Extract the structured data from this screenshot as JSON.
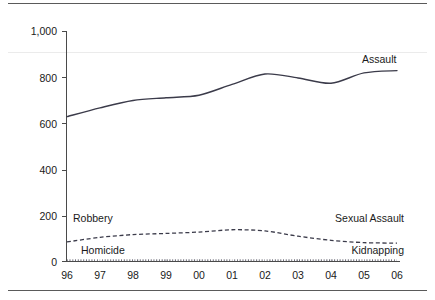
{
  "chart_data": {
    "type": "line",
    "title": "",
    "subtitle": "",
    "xlabel": "",
    "ylabel": "",
    "x": [
      "96",
      "97",
      "98",
      "99",
      "00",
      "01",
      "02",
      "03",
      "04",
      "05",
      "06"
    ],
    "xtick_labels": [
      "96",
      "97",
      "98",
      "99",
      "00",
      "01",
      "02",
      "03",
      "04",
      "05",
      "06"
    ],
    "ytick_labels": [
      "0",
      "200",
      "400",
      "600",
      "800",
      "1,000"
    ],
    "ytick_values": [
      0,
      200,
      400,
      600,
      800,
      1000
    ],
    "ylim": [
      0,
      1000
    ],
    "grid": false,
    "legend_position": "inline-annotations",
    "series": [
      {
        "name": "Assault",
        "style": "solid",
        "label": "Assault",
        "values": [
          630,
          668,
          700,
          712,
          723,
          770,
          815,
          798,
          775,
          820,
          830
        ]
      },
      {
        "name": "Robbery / Sexual Assault",
        "style": "dashed",
        "label_left": "Robbery",
        "label_right": "Sexual Assault",
        "values": [
          85,
          105,
          117,
          122,
          128,
          138,
          133,
          110,
          92,
          82,
          80
        ]
      },
      {
        "name": "Homicide / Kidnapping",
        "style": "dotted",
        "label_left": "Homicide",
        "label_right": "Kidnapping",
        "values": [
          6,
          6,
          6,
          6,
          6,
          6,
          6,
          6,
          6,
          6,
          6
        ]
      }
    ],
    "annotations": [
      {
        "text": "Assault",
        "anchor": "top-right"
      },
      {
        "text": "Robbery",
        "anchor": "left-middle-low"
      },
      {
        "text": "Sexual Assault",
        "anchor": "right-middle-low"
      },
      {
        "text": "Homicide",
        "anchor": "left-bottom"
      },
      {
        "text": "Kidnapping",
        "anchor": "right-bottom"
      }
    ],
    "colors": {
      "line": "#3b3b4a",
      "axis": "#4a4a4a",
      "text": "#1a1a1a",
      "rule": "#5a5a5a",
      "faint_grid": "#ebebeb"
    }
  },
  "labels": {
    "y": {
      "t0": "0",
      "t200": "200",
      "t400": "400",
      "t600": "600",
      "t800": "800",
      "t1000": "1,000"
    },
    "x": {
      "y96": "96",
      "y97": "97",
      "y98": "98",
      "y99": "99",
      "y00": "00",
      "y01": "01",
      "y02": "02",
      "y03": "03",
      "y04": "04",
      "y05": "05",
      "y06": "06"
    },
    "series": {
      "assault": "Assault",
      "robbery": "Robbery",
      "sexual_assault": "Sexual Assault",
      "homicide": "Homicide",
      "kidnapping": "Kidnapping"
    }
  }
}
